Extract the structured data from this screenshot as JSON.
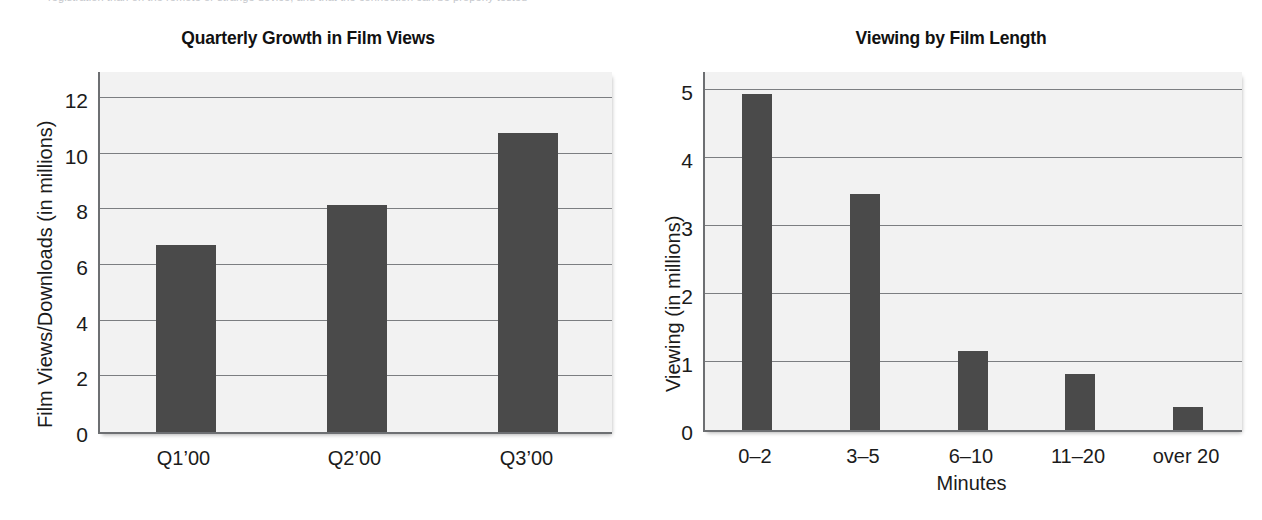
{
  "page": {
    "cropped_header_text": "registration than on the remote or strange device, and that the connection can be properly tested"
  },
  "chart_data": [
    {
      "id": "quarterly-growth",
      "type": "bar",
      "title": "Quarterly Growth in Film Views",
      "xlabel": "",
      "ylabel": "Film Views/Downloads (in millions)",
      "categories": [
        "Q1’00",
        "Q2’00",
        "Q3’00"
      ],
      "values": [
        6.7,
        8.15,
        10.75
      ],
      "ylim": [
        0,
        13
      ],
      "yticks": [
        0,
        2,
        4,
        6,
        8,
        10,
        12
      ],
      "ytick_labels": [
        "0",
        "2",
        "4",
        "6",
        "8",
        "10",
        "12"
      ],
      "grid": true,
      "legend": "none",
      "bar_color": "#4a4a4a",
      "plot_background": "#f2f2f2"
    },
    {
      "id": "viewing-by-film-length",
      "type": "bar",
      "title": "Viewing by Film Length",
      "xlabel": "Minutes",
      "ylabel": "Viewing (in millions)",
      "categories": [
        "0–2",
        "3–5",
        "6–10",
        "11–20",
        "over 20"
      ],
      "values": [
        4.95,
        3.48,
        1.16,
        0.82,
        0.34
      ],
      "ylim": [
        0,
        5.3
      ],
      "yticks": [
        0,
        1,
        2,
        3,
        4,
        5
      ],
      "ytick_labels": [
        "0",
        "1",
        "2",
        "3",
        "4",
        "5"
      ],
      "grid": true,
      "legend": "none",
      "bar_color": "#4a4a4a",
      "plot_background": "#f2f2f2"
    }
  ]
}
